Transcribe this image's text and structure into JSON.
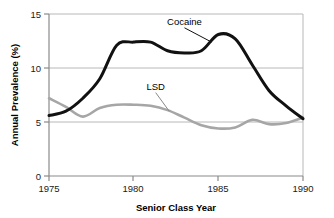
{
  "chart_data": {
    "type": "line",
    "title": "",
    "xlabel": "Senior Class Year",
    "ylabel": "Annual Prevalence (%)",
    "xlim": [
      1975,
      1990
    ],
    "ylim": [
      0,
      15
    ],
    "xticks": [
      1975,
      1980,
      1985,
      1990
    ],
    "xtick_labels": [
      "1975",
      "1980",
      "1985",
      "1990"
    ],
    "yticks": [
      0,
      5,
      10,
      15
    ],
    "ytick_labels": [
      "0",
      "5",
      "10",
      "15"
    ],
    "grid": "horizontal",
    "legend_position": "inline-annotation",
    "x": [
      1975,
      1976,
      1977,
      1978,
      1979,
      1980,
      1981,
      1982,
      1983,
      1984,
      1985,
      1986,
      1987,
      1988,
      1989,
      1990
    ],
    "series": [
      {
        "name": "Cocaine",
        "color": "#111111",
        "values": [
          5.6,
          6.0,
          7.2,
          9.0,
          12.1,
          12.4,
          12.4,
          11.6,
          11.4,
          11.6,
          13.1,
          12.7,
          10.3,
          7.9,
          6.5,
          5.3
        ]
      },
      {
        "name": "LSD",
        "color": "#a6a6a6",
        "values": [
          7.2,
          6.4,
          5.5,
          6.3,
          6.6,
          6.6,
          6.5,
          6.1,
          5.4,
          4.7,
          4.4,
          4.5,
          5.2,
          4.8,
          4.9,
          5.4
        ]
      }
    ],
    "annotations": [
      {
        "text": "Cocaine",
        "label_x": 1983.0,
        "label_y": 14.0,
        "point_x": 1984.6,
        "point_y": 12.4
      },
      {
        "text": "LSD",
        "label_x": 1981.3,
        "label_y": 8.0,
        "point_x": 1982.1,
        "point_y": 6.0
      }
    ]
  },
  "axis": {
    "y_title": "Annual Prevalence (%)",
    "x_title": "Senior Class Year"
  },
  "colors": {
    "cocaine_line": "#111111",
    "lsd_line": "#a6a6a6",
    "gridline": "#b8b8b8",
    "axis": "#8a8a8a",
    "text": "#1a1a1a",
    "background": "#ffffff"
  }
}
